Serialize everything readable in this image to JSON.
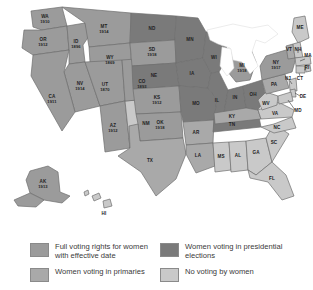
{
  "map": {
    "title": "Women's suffrage in the United States by state",
    "colors": {
      "full_voting_rights": "#9b9b9b",
      "presidential_elections": "#7a7a7a",
      "primaries": "#a9a9a9",
      "no_voting": "#c9c9c9",
      "border": "#6e6e6e",
      "water": "#ffffff"
    },
    "states": [
      {
        "abbr": "WA",
        "year": "1910",
        "category": "full"
      },
      {
        "abbr": "OR",
        "year": "1912",
        "category": "full"
      },
      {
        "abbr": "ID",
        "year": "1896",
        "category": "full"
      },
      {
        "abbr": "MT",
        "year": "1914",
        "category": "full"
      },
      {
        "abbr": "WY",
        "year": "1869",
        "category": "full"
      },
      {
        "abbr": "NV",
        "year": "1914",
        "category": "full"
      },
      {
        "abbr": "UT",
        "year": "1870",
        "category": "full"
      },
      {
        "abbr": "CA",
        "year": "1911",
        "category": "full"
      },
      {
        "abbr": "AZ",
        "year": "1912",
        "category": "full"
      },
      {
        "abbr": "CO",
        "year": "1893",
        "category": "full"
      },
      {
        "abbr": "KS",
        "year": "1912",
        "category": "full"
      },
      {
        "abbr": "SD",
        "year": "1918",
        "category": "full"
      },
      {
        "abbr": "OK",
        "year": "1918",
        "category": "full"
      },
      {
        "abbr": "MI",
        "year": "1918",
        "category": "full"
      },
      {
        "abbr": "NY",
        "year": "1917",
        "category": "full"
      },
      {
        "abbr": "AK",
        "year": "1913",
        "category": "full"
      },
      {
        "abbr": "NM",
        "year": "",
        "category": "none"
      },
      {
        "abbr": "TX",
        "year": "",
        "category": "prim"
      },
      {
        "abbr": "ND",
        "year": "",
        "category": "pres"
      },
      {
        "abbr": "MN",
        "year": "",
        "category": "pres"
      },
      {
        "abbr": "NE",
        "year": "",
        "category": "pres"
      },
      {
        "abbr": "IA",
        "year": "",
        "category": "pres"
      },
      {
        "abbr": "WI",
        "year": "",
        "category": "pres"
      },
      {
        "abbr": "MO",
        "year": "",
        "category": "pres"
      },
      {
        "abbr": "IL",
        "year": "",
        "category": "pres"
      },
      {
        "abbr": "IN",
        "year": "",
        "category": "pres"
      },
      {
        "abbr": "OH",
        "year": "",
        "category": "pres"
      },
      {
        "abbr": "TN",
        "year": "",
        "category": "pres"
      },
      {
        "abbr": "AR",
        "year": "",
        "category": "prim"
      },
      {
        "abbr": "KY",
        "year": "",
        "category": "prim"
      },
      {
        "abbr": "PA",
        "year": "",
        "category": "prim"
      },
      {
        "abbr": "LA",
        "year": "",
        "category": "prim"
      },
      {
        "abbr": "VT",
        "year": "",
        "category": "prim"
      },
      {
        "abbr": "ME",
        "year": "",
        "category": "none"
      },
      {
        "abbr": "NH",
        "year": "",
        "category": "none"
      },
      {
        "abbr": "MA",
        "year": "",
        "category": "none"
      },
      {
        "abbr": "RI",
        "year": "",
        "category": "none"
      },
      {
        "abbr": "CT",
        "year": "",
        "category": "none"
      },
      {
        "abbr": "NJ",
        "year": "",
        "category": "none"
      },
      {
        "abbr": "DE",
        "year": "",
        "category": "none"
      },
      {
        "abbr": "MD",
        "year": "",
        "category": "none"
      },
      {
        "abbr": "WV",
        "year": "",
        "category": "none"
      },
      {
        "abbr": "VA",
        "year": "",
        "category": "none"
      },
      {
        "abbr": "NC",
        "year": "",
        "category": "none"
      },
      {
        "abbr": "SC",
        "year": "",
        "category": "none"
      },
      {
        "abbr": "GA",
        "year": "",
        "category": "none"
      },
      {
        "abbr": "AL",
        "year": "",
        "category": "none"
      },
      {
        "abbr": "MS",
        "year": "",
        "category": "none"
      },
      {
        "abbr": "FL",
        "year": "",
        "category": "none"
      },
      {
        "abbr": "HI",
        "year": "",
        "category": "none"
      }
    ]
  },
  "legend": {
    "items": [
      {
        "key": "full",
        "label": "Full voting rights for women with effective date",
        "swatch": "#9b9b9b"
      },
      {
        "key": "pres",
        "label": "Women voting in presidential elections",
        "swatch": "#7a7a7a"
      },
      {
        "key": "prim",
        "label": "Women voting in primaries",
        "swatch": "#a9a9a9"
      },
      {
        "key": "none",
        "label": "No voting by women",
        "swatch": "#c9c9c9"
      }
    ]
  }
}
